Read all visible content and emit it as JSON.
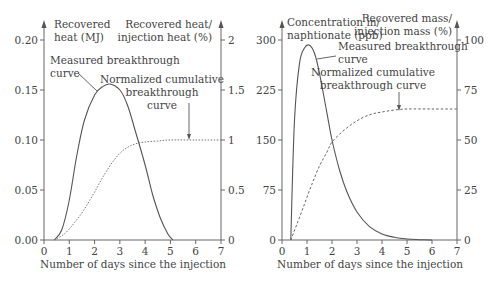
{
  "chart_data": [
    {
      "type": "line",
      "title": "",
      "xlabel": "Number of days since the injection",
      "ylabel": "Recovered heat (MJ)",
      "ylabel_right": "Recovered heat/ injection heat (%)",
      "xlim": [
        0,
        7
      ],
      "ylim": [
        0,
        0.2
      ],
      "ylim_right": [
        0,
        2
      ],
      "x_ticks": [
        "0",
        "1",
        "2",
        "3",
        "4",
        "5",
        "6",
        "7"
      ],
      "y_ticks": [
        "0.00",
        "0.05",
        "0.10",
        "0.15",
        "0.20"
      ],
      "y_ticks_right": [
        "0",
        "0.5",
        "1",
        "1.5",
        "2"
      ],
      "grid": false,
      "annotations": [
        "Measured breakthrough curve",
        "Normalized cumulative breakthrough curve"
      ],
      "series": [
        {
          "name": "Measured breakthrough curve",
          "axis": "left",
          "style": "solid",
          "x": [
            0.4,
            0.7,
            1.0,
            1.3,
            1.6,
            2.0,
            2.3,
            2.6,
            3.0,
            3.3,
            3.6,
            4.0,
            4.3,
            4.6,
            4.9,
            5.1
          ],
          "values": [
            0.0,
            0.01,
            0.04,
            0.085,
            0.12,
            0.145,
            0.153,
            0.156,
            0.15,
            0.135,
            0.11,
            0.075,
            0.045,
            0.022,
            0.006,
            0.0
          ]
        },
        {
          "name": "Normalized cumulative breakthrough curve",
          "axis": "right",
          "style": "dotted",
          "x": [
            0.4,
            0.8,
            1.2,
            1.6,
            2.0,
            2.4,
            2.8,
            3.2,
            3.6,
            4.0,
            4.5,
            5.0,
            6.0,
            7.0
          ],
          "values": [
            0.0,
            0.06,
            0.17,
            0.31,
            0.48,
            0.66,
            0.81,
            0.91,
            0.96,
            0.98,
            0.99,
            1.0,
            1.0,
            1.0
          ]
        }
      ]
    },
    {
      "type": "line",
      "title": "",
      "xlabel": "Number of days since the injection",
      "ylabel": "Concentration in/ naphtionate (ppb)",
      "ylabel_right": "Recovered mass/ injection mass (%)",
      "xlim": [
        0,
        7
      ],
      "ylim": [
        0,
        300
      ],
      "ylim_right": [
        0,
        100
      ],
      "x_ticks": [
        "0",
        "1",
        "2",
        "3",
        "4",
        "5",
        "6",
        "7"
      ],
      "y_ticks": [
        "0",
        "75",
        "150",
        "225",
        "300"
      ],
      "y_ticks_right": [
        "0",
        "25",
        "50",
        "75",
        "100"
      ],
      "grid": false,
      "annotations": [
        "Measured breakthrough curve",
        "Normalized cumulative breakthrough curve"
      ],
      "series": [
        {
          "name": "Measured breakthrough curve",
          "axis": "left",
          "style": "solid",
          "x": [
            0.35,
            0.5,
            0.7,
            0.9,
            1.1,
            1.3,
            1.5,
            1.8,
            2.0,
            2.3,
            2.6,
            3.0,
            3.5,
            4.0,
            4.5,
            5.0,
            5.5,
            6.0
          ],
          "values": [
            0,
            180,
            265,
            288,
            292,
            280,
            250,
            190,
            150,
            105,
            72,
            42,
            20,
            9,
            4,
            1.5,
            0.5,
            0
          ]
        },
        {
          "name": "Normalized cumulative breakthrough curve",
          "axis": "right",
          "style": "dashed",
          "x": [
            0.35,
            0.6,
            0.9,
            1.2,
            1.5,
            1.8,
            2.0,
            2.4,
            2.8,
            3.2,
            3.6,
            4.0,
            4.5,
            5.0,
            6.0,
            7.0
          ],
          "values": [
            0,
            8,
            18,
            28,
            37,
            44,
            49,
            54,
            58,
            61,
            63,
            64,
            65,
            65.5,
            65.5,
            65.5
          ]
        }
      ]
    }
  ],
  "labels": {
    "left": {
      "ylabel_line1": "Recovered",
      "ylabel_line2": "heat (MJ)",
      "yrlabel_line1": "Recovered heat/",
      "yrlabel_line2": "injection heat (%)",
      "measured_line1": "Measured breakthrough",
      "measured_line2": "curve",
      "norm_line1": "Normalized cumulative",
      "norm_line2": "breakthrough",
      "norm_line3": "curve",
      "xlabel": "Number of days since the injection"
    },
    "right": {
      "ylabel_line1": "Concentration in/",
      "ylabel_line2": "naphtionate (ppb)",
      "yrlabel_line1": "Recovered mass/",
      "yrlabel_line2": "injection mass (%)",
      "measured_line1": "Measured breakthrough",
      "measured_line2": "curve",
      "norm_line1": "Normalized cumulative",
      "norm_line2": "breakthrough curve",
      "xlabel": "Number of days since the injection"
    }
  }
}
